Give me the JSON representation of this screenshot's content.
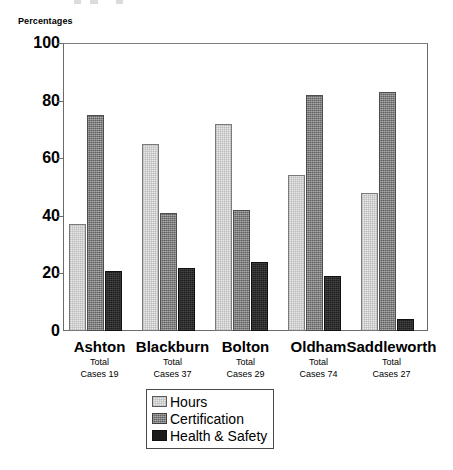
{
  "chart_data": {
    "type": "bar",
    "title": "",
    "xlabel": "",
    "ylabel": "Percentages",
    "ylim": [
      0,
      100
    ],
    "yticks": [
      0,
      20,
      40,
      60,
      80,
      100
    ],
    "grid": false,
    "legend_position": "bottom-center",
    "categories": [
      "Ashton",
      "Blackburn",
      "Bolton",
      "Oldham",
      "Saddleworth"
    ],
    "category_notes": [
      {
        "line1": "Total",
        "line2": "Cases 19"
      },
      {
        "line1": "Total",
        "line2": "Cases 37"
      },
      {
        "line1": "Total",
        "line2": "Cases 29"
      },
      {
        "line1": "Total",
        "line2": "Cases 74"
      },
      {
        "line1": "Total",
        "line2": "Cases 27"
      }
    ],
    "total_cases": [
      19,
      37,
      29,
      74,
      27
    ],
    "series": [
      {
        "name": "Hours",
        "color": "#e8e8e8",
        "values": [
          37,
          65,
          72,
          54,
          48
        ]
      },
      {
        "name": "Certification",
        "color": "#7a7a7a",
        "values": [
          75,
          41,
          42,
          82,
          83
        ]
      },
      {
        "name": "Health & Safety",
        "color": "#1a1a1a",
        "values": [
          21,
          22,
          24,
          19,
          4
        ]
      }
    ]
  },
  "axis": {
    "y_title": "Percentages",
    "ticks": [
      "100",
      "80",
      "60",
      "40",
      "20",
      "0"
    ]
  },
  "legend": {
    "items": [
      {
        "label": "Hours"
      },
      {
        "label": "Certification"
      },
      {
        "label": "Health & Safety"
      }
    ]
  }
}
